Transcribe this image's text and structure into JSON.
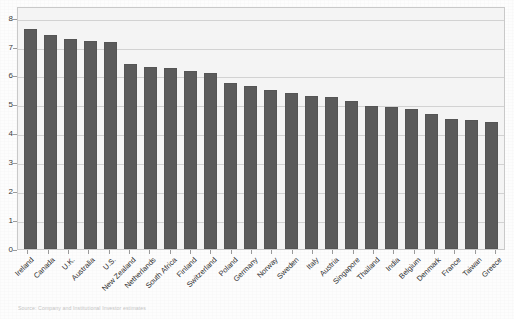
{
  "chart_data": {
    "type": "bar",
    "title": "",
    "subtitle": "",
    "xlabel": "",
    "ylabel": "",
    "ylim": [
      0,
      8.4
    ],
    "yticks": [
      0,
      1,
      2,
      3,
      4,
      5,
      6,
      7,
      8
    ],
    "grid": true,
    "legend": null,
    "bar_color": "#5b5b5b",
    "plot_background": "#f4f4f4",
    "categories": [
      "Ireland",
      "Canada",
      "U.K.",
      "Australia",
      "U.S.",
      "New Zealand",
      "Netherlands",
      "South Africa",
      "Finland",
      "Switzerland",
      "Poland",
      "Germany",
      "Norway",
      "Sweden",
      "Italy",
      "Austria",
      "Singapore",
      "Thailand",
      "India",
      "Belgium",
      "Denmark",
      "France",
      "Taiwan",
      "Greece"
    ],
    "values": [
      7.6,
      7.4,
      7.25,
      7.2,
      7.15,
      6.4,
      6.3,
      6.25,
      6.15,
      6.1,
      5.75,
      5.65,
      5.5,
      5.4,
      5.3,
      5.25,
      5.1,
      4.95,
      4.9,
      4.85,
      4.65,
      4.5,
      4.45,
      4.4
    ]
  },
  "caption": {
    "text": "Source: Company and Institutional Investor estimates"
  }
}
